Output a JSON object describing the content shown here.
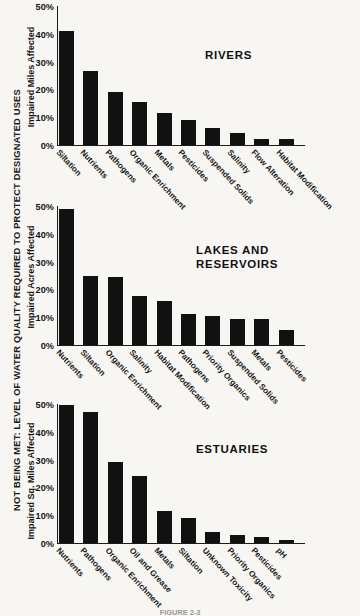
{
  "figure": {
    "master_axis_label": "NOT BEING MET: LEVEL OF WATER QUALITY REQUIRED TO PROTECT DESIGNATED USES",
    "bottom_caption": "FIGURE 2-3",
    "background_color": "#f7f6f3",
    "bar_color": "#111111",
    "axis_color": "#1b1b1b"
  },
  "chart_data": [
    {
      "type": "bar",
      "title": "RIVERS",
      "ylabel": "Impaired Miles Affected",
      "xlabel": "",
      "ylim": [
        0,
        50
      ],
      "yticks": [
        "0%",
        "10%",
        "20%",
        "30%",
        "40%",
        "50%"
      ],
      "ytick_values": [
        0,
        10,
        20,
        30,
        40,
        50
      ],
      "grid": false,
      "categories": [
        "Siltation",
        "Nutrients",
        "Pathogens",
        "Organic Enrichment",
        "Metals",
        "Pesticides",
        "Suspended Solids",
        "Salinity",
        "Flow Alteration",
        "Habitat Modification"
      ],
      "values": [
        41,
        26.5,
        19,
        15.5,
        11.5,
        9,
        6,
        4.5,
        2,
        2
      ]
    },
    {
      "type": "bar",
      "title": "LAKES AND\nRESERVOIRS",
      "ylabel": "Impaired Acres Affected",
      "xlabel": "",
      "ylim": [
        0,
        50
      ],
      "yticks": [
        "0%",
        "10%",
        "20%",
        "30%",
        "40%",
        "50%"
      ],
      "ytick_values": [
        0,
        10,
        20,
        30,
        40,
        50
      ],
      "grid": false,
      "categories": [
        "Nutrients",
        "Siltation",
        "Organic Enrichment",
        "Salinity",
        "Habitat Modification",
        "Pathogens",
        "Priority Organics",
        "Suspended Solids",
        "Metals",
        "Pesticides"
      ],
      "values": [
        49,
        25,
        24.5,
        17.5,
        16,
        11,
        10.5,
        9.5,
        9.5,
        5.5
      ]
    },
    {
      "type": "bar",
      "title": "ESTUARIES",
      "ylabel": "Impaired Sq. Miles Affected",
      "xlabel": "",
      "ylim": [
        0,
        50
      ],
      "yticks": [
        "0%",
        "10%",
        "20%",
        "30%",
        "40%",
        "50%"
      ],
      "ytick_values": [
        0,
        10,
        20,
        30,
        40,
        50
      ],
      "grid": false,
      "categories": [
        "Nutrients",
        "Pathogens",
        "Organic Enrichment",
        "Oil and Grease",
        "Metals",
        "Siltation",
        "Unknown Toxicity",
        "Priority Organics",
        "Pesticides",
        "pH"
      ],
      "values": [
        49.5,
        47,
        29,
        24,
        11.5,
        9,
        4,
        3,
        2,
        1
      ]
    }
  ]
}
